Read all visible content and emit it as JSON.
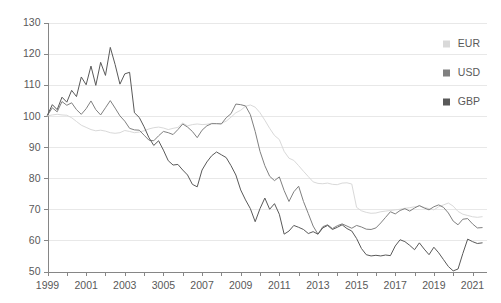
{
  "chart_data": {
    "type": "line",
    "title": "",
    "subtitle": "",
    "xlabel": "",
    "ylabel": "",
    "xlim": [
      1999,
      2021.75
    ],
    "ylim": [
      50,
      130
    ],
    "y_ticks": [
      50,
      60,
      70,
      80,
      90,
      100,
      110,
      120,
      130
    ],
    "x_tick_labels": [
      "1999",
      "2001",
      "2003",
      "3005",
      "2007",
      "2009",
      "2011",
      "2013",
      "2015",
      "2017",
      "2019",
      "2021"
    ],
    "x_tick_values": [
      1999,
      2001,
      2003,
      2005,
      2007,
      2009,
      2011,
      2013,
      2015,
      2017,
      2019,
      2021
    ],
    "x_minor_ticks": [
      1999,
      2000,
      2001,
      2002,
      2003,
      2004,
      2005,
      2006,
      2007,
      2008,
      2009,
      2010,
      2011,
      2012,
      2013,
      2014,
      2015,
      2016,
      2017,
      2018,
      2019,
      2020,
      2021
    ],
    "grid": true,
    "grid_axis": "y",
    "legend_position": "top-right",
    "colors": {
      "EUR": "#d9d9d9",
      "USD": "#808080",
      "GBP": "#595959",
      "gridline": "#e8e8e8",
      "axis": "#868686",
      "text": "#595959",
      "background": "#ffffff"
    },
    "series": [
      {
        "name": "EUR",
        "color": "#d9d9d9",
        "x": [
          1999.0,
          1999.25,
          1999.5,
          1999.75,
          2000.0,
          2000.25,
          2000.5,
          2000.75,
          2001.0,
          2001.25,
          2001.5,
          2001.75,
          2002.0,
          2002.25,
          2002.5,
          2002.75,
          2003.0,
          2003.25,
          2003.5,
          2003.75,
          2004.0,
          2004.25,
          2004.5,
          2004.75,
          2005.0,
          2005.25,
          2005.5,
          2005.75,
          2006.0,
          2006.25,
          2006.5,
          2006.75,
          2007.0,
          2007.25,
          2007.5,
          2007.75,
          2008.0,
          2008.25,
          2008.5,
          2008.75,
          2009.0,
          2009.25,
          2009.5,
          2009.75,
          2010.0,
          2010.25,
          2010.5,
          2010.75,
          2011.0,
          2011.25,
          2011.5,
          2011.75,
          2012.0,
          2012.25,
          2012.5,
          2012.75,
          2013.0,
          2013.25,
          2013.5,
          2013.75,
          2014.0,
          2014.25,
          2014.5,
          2014.75,
          2015.0,
          2015.25,
          2015.5,
          2015.75,
          2016.0,
          2016.25,
          2016.5,
          2016.75,
          2017.0,
          2017.25,
          2017.5,
          2017.75,
          2018.0,
          2018.25,
          2018.5,
          2018.75,
          2019.0,
          2019.25,
          2019.5,
          2019.75,
          2020.0,
          2020.25,
          2020.5,
          2020.75,
          2021.0,
          2021.25,
          2021.5
        ],
        "values": [
          100.0,
          100.3,
          100.5,
          100.3,
          100.2,
          99.4,
          98.2,
          97.0,
          96.3,
          95.6,
          95.2,
          95.4,
          95.1,
          94.6,
          94.4,
          94.6,
          95.3,
          95.0,
          94.6,
          94.8,
          95.2,
          95.8,
          96.2,
          96.4,
          96.1,
          95.6,
          96.0,
          96.3,
          97.7,
          96.8,
          97.2,
          97.4,
          97.2,
          97.3,
          97.6,
          97.5,
          97.6,
          98.3,
          99.6,
          101.0,
          101.8,
          103.1,
          103.5,
          102.8,
          101.0,
          98.6,
          96.0,
          93.7,
          92.4,
          88.6,
          86.4,
          85.7,
          84.0,
          82.2,
          80.5,
          78.8,
          78.3,
          78.2,
          78.4,
          78.0,
          77.9,
          78.4,
          78.5,
          78.1,
          70.6,
          69.5,
          69.0,
          68.7,
          68.8,
          69.2,
          69.4,
          69.6,
          69.8,
          70.0,
          70.3,
          70.5,
          70.8,
          71.0,
          70.6,
          70.2,
          69.8,
          70.8,
          71.4,
          72.0,
          71.0,
          69.3,
          68.4,
          68.0,
          67.6,
          67.4,
          67.6
        ]
      },
      {
        "name": "USD",
        "color": "#808080",
        "x": [
          1999.0,
          1999.25,
          1999.5,
          1999.75,
          2000.0,
          2000.25,
          2000.5,
          2000.75,
          2001.0,
          2001.25,
          2001.5,
          2001.75,
          2002.0,
          2002.25,
          2002.5,
          2002.75,
          2003.0,
          2003.25,
          2003.5,
          2003.75,
          2004.0,
          2004.25,
          2004.5,
          2004.75,
          2005.0,
          2005.25,
          2005.5,
          2005.75,
          2006.0,
          2006.25,
          2006.5,
          2006.75,
          2007.0,
          2007.25,
          2007.5,
          2007.75,
          2008.0,
          2008.25,
          2008.5,
          2008.75,
          2009.0,
          2009.25,
          2009.5,
          2009.75,
          2010.0,
          2010.25,
          2010.5,
          2010.75,
          2011.0,
          2011.25,
          2011.5,
          2011.75,
          2012.0,
          2012.25,
          2012.5,
          2012.75,
          2013.0,
          2013.25,
          2013.5,
          2013.75,
          2014.0,
          2014.25,
          2014.5,
          2014.75,
          2015.0,
          2015.25,
          2015.5,
          2015.75,
          2016.0,
          2016.25,
          2016.5,
          2016.75,
          2017.0,
          2017.25,
          2017.5,
          2017.75,
          2018.0,
          2018.25,
          2018.5,
          2018.75,
          2019.0,
          2019.25,
          2019.5,
          2019.75,
          2020.0,
          2020.25,
          2020.5,
          2020.75,
          2021.0,
          2021.25,
          2021.5
        ],
        "values": [
          100.2,
          102.6,
          101.3,
          104.6,
          103.4,
          104.2,
          102.0,
          100.5,
          102.3,
          104.8,
          102.0,
          100.3,
          102.6,
          104.9,
          102.5,
          100.0,
          98.3,
          96.0,
          95.5,
          95.4,
          93.8,
          92.2,
          92.0,
          93.6,
          95.0,
          94.6,
          94.0,
          95.6,
          97.4,
          96.4,
          95.0,
          93.0,
          95.4,
          96.8,
          97.5,
          97.5,
          97.4,
          99.4,
          100.7,
          103.8,
          103.6,
          103.2,
          100.4,
          95.0,
          88.6,
          84.0,
          80.6,
          79.2,
          80.4,
          76.0,
          72.5,
          75.6,
          77.4,
          72.5,
          68.6,
          64.6,
          62.0,
          64.4,
          65.0,
          63.8,
          64.7,
          65.3,
          64.6,
          63.9,
          64.8,
          64.3,
          63.6,
          63.5,
          64.0,
          65.6,
          67.4,
          69.2,
          68.5,
          69.6,
          70.2,
          69.4,
          70.4,
          71.2,
          70.4,
          69.8,
          70.8,
          71.4,
          70.6,
          68.8,
          66.2,
          65.0,
          66.8,
          67.0,
          65.3,
          64.0,
          64.1
        ]
      },
      {
        "name": "GBP",
        "color": "#595959",
        "x": [
          1999.0,
          1999.25,
          1999.5,
          1999.75,
          2000.0,
          2000.25,
          2000.5,
          2000.75,
          2001.0,
          2001.25,
          2001.5,
          2001.75,
          2002.0,
          2002.25,
          2002.5,
          2002.75,
          2003.0,
          2003.25,
          2003.5,
          2003.75,
          2004.0,
          2004.25,
          2004.5,
          2004.75,
          2005.0,
          2005.25,
          2005.5,
          2005.75,
          2006.0,
          2006.25,
          2006.5,
          2006.75,
          2007.0,
          2007.25,
          2007.5,
          2007.75,
          2008.0,
          2008.25,
          2008.5,
          2008.75,
          2009.0,
          2009.25,
          2009.5,
          2009.75,
          2010.0,
          2010.25,
          2010.5,
          2010.75,
          2011.0,
          2011.25,
          2011.5,
          2011.75,
          2012.0,
          2012.25,
          2012.5,
          2012.75,
          2013.0,
          2013.25,
          2013.5,
          2013.75,
          2014.0,
          2014.25,
          2014.5,
          2014.75,
          2015.0,
          2015.25,
          2015.5,
          2015.75,
          2016.0,
          2016.25,
          2016.5,
          2016.75,
          2017.0,
          2017.25,
          2017.5,
          2017.75,
          2018.0,
          2018.25,
          2018.5,
          2018.75,
          2019.0,
          2019.25,
          2019.5,
          2019.75,
          2020.0,
          2020.25,
          2020.5,
          2020.75,
          2021.0,
          2021.25,
          2021.5
        ],
        "values": [
          100.3,
          103.6,
          102.0,
          106.0,
          104.4,
          108.2,
          106.2,
          112.5,
          110.0,
          116.0,
          109.8,
          117.2,
          113.0,
          122.0,
          116.5,
          110.2,
          113.5,
          114.0,
          101.0,
          99.5,
          96.5,
          93.0,
          90.5,
          92.0,
          89.0,
          85.6,
          84.2,
          84.4,
          82.6,
          81.0,
          78.0,
          77.2,
          82.6,
          85.2,
          87.2,
          88.4,
          87.5,
          86.6,
          84.0,
          81.0,
          76.2,
          73.0,
          70.2,
          66.0,
          70.2,
          73.6,
          70.0,
          71.8,
          68.4,
          62.0,
          63.0,
          64.8,
          64.2,
          63.5,
          62.2,
          62.8,
          62.0,
          64.0,
          64.8,
          63.5,
          64.2,
          65.0,
          63.8,
          63.0,
          60.6,
          57.4,
          55.4,
          55.0,
          55.2,
          55.0,
          55.3,
          55.1,
          58.2,
          60.2,
          59.6,
          58.4,
          57.0,
          59.2,
          57.2,
          55.4,
          57.8,
          56.0,
          53.8,
          51.6,
          50.2,
          50.8,
          55.8,
          60.4,
          59.6,
          59.0,
          59.2
        ]
      }
    ]
  },
  "legend": {
    "items": [
      {
        "label": "EUR",
        "color": "#d9d9d9"
      },
      {
        "label": "USD",
        "color": "#808080"
      },
      {
        "label": "GBP",
        "color": "#595959"
      }
    ]
  }
}
